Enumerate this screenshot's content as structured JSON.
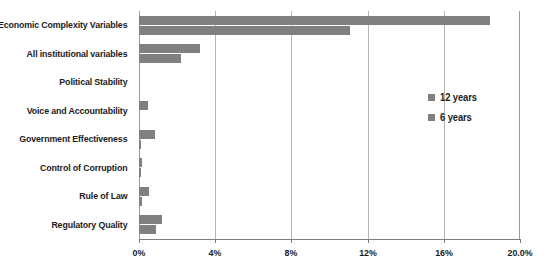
{
  "chart_data": {
    "type": "bar",
    "orientation": "horizontal",
    "title": "",
    "subtitle": "",
    "xlabel": "",
    "ylabel": "",
    "xlim": [
      0,
      20
    ],
    "grid": true,
    "legend_position": "right",
    "categories": [
      "Economic Complexity Variables",
      "All institutional variables",
      "Political Stability",
      "Voice and Accountability",
      "Government Effectiveness",
      "Control of Corruption",
      "Rule of Law",
      "Regulatory Quality"
    ],
    "series": [
      {
        "name": "12 years",
        "color": "#808080",
        "values": [
          18.4,
          3.2,
          0.0,
          0.45,
          0.85,
          0.15,
          0.5,
          1.2
        ]
      },
      {
        "name": "6 years",
        "color": "#808080",
        "values": [
          11.1,
          2.2,
          0.0,
          0.0,
          0.1,
          0.1,
          0.15,
          0.9
        ]
      }
    ],
    "xticks": [
      0,
      4,
      8,
      12,
      16,
      20
    ],
    "xtick_labels": [
      "0%",
      "4%",
      "8%",
      "12%",
      "16%",
      "20.0%"
    ]
  },
  "legend": {
    "items": [
      {
        "label": "12 years"
      },
      {
        "label": "6 years"
      }
    ]
  }
}
